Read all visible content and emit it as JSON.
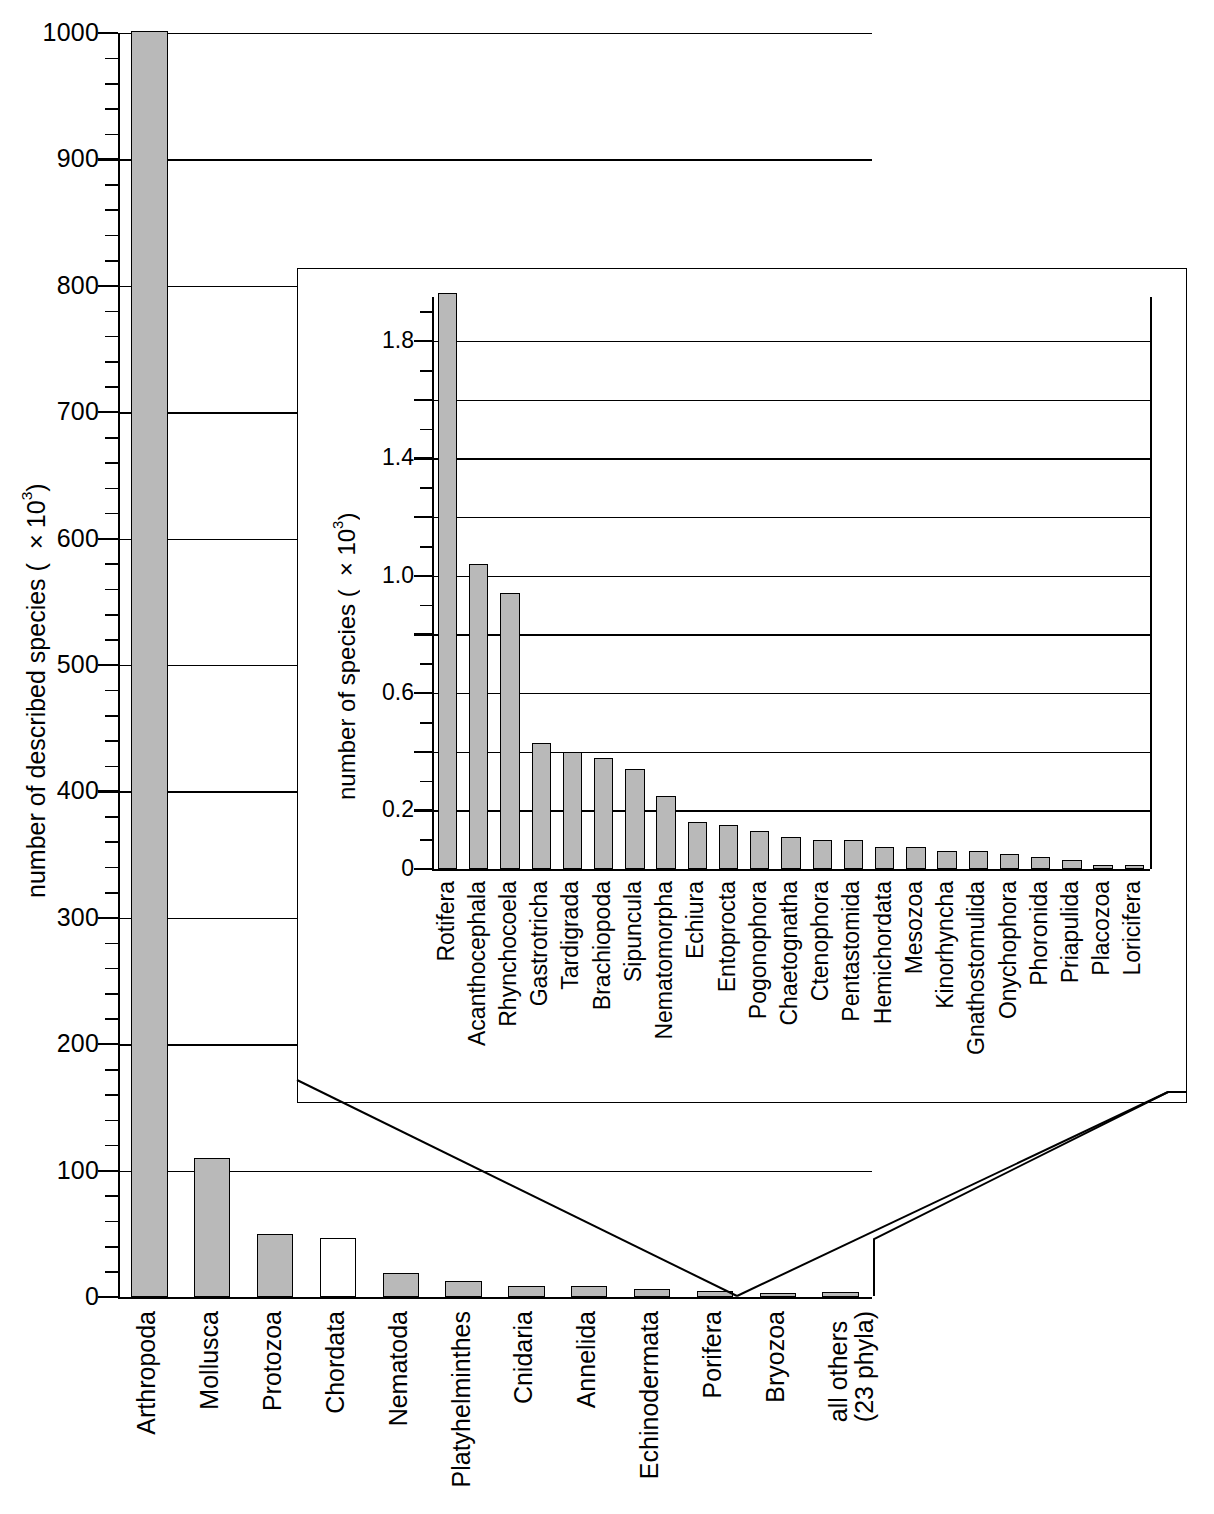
{
  "chart_data": {
    "type": "bar",
    "title": "",
    "panels": [
      {
        "name": "main",
        "ylabel": "number of described species (×10³)",
        "ylabel_base": "number of described species ( ×10",
        "ylabel_exp": "3",
        "ylabel_close": ")",
        "ylim": [
          0,
          1000
        ],
        "ytick_step": 100,
        "yminor_step": 20,
        "grid": true,
        "legend": "none",
        "yticks": [
          "0",
          "100",
          "200",
          "300",
          "400",
          "500",
          "600",
          "700",
          "800",
          "900",
          "1000"
        ],
        "categories": [
          "Arthropoda",
          "Mollusca",
          "Protozoa",
          "Chordata",
          "Nematoda",
          "Platyhelminthes",
          "Cnidaria",
          "Annelida",
          "Echinodermata",
          "Porifera",
          "Bryozoa",
          "all others\n(23 phyla)"
        ],
        "values": [
          1065,
          110,
          50,
          47,
          19,
          13,
          9,
          9,
          6,
          5,
          3,
          4
        ],
        "fills": [
          "gray",
          "gray",
          "gray",
          "white",
          "gray",
          "gray",
          "gray",
          "gray",
          "gray",
          "gray",
          "gray",
          "gray"
        ],
        "clipped": [
          true,
          false,
          false,
          false,
          false,
          false,
          false,
          false,
          false,
          false,
          false,
          false
        ]
      },
      {
        "name": "inset",
        "ylabel": "number of species (×10³)",
        "ylabel_base": "number of species ( ×10",
        "ylabel_exp": "3",
        "ylabel_close": ")",
        "ylim": [
          0,
          1.95
        ],
        "ytick_step": 0.2,
        "yminor_step": 0.1,
        "grid": true,
        "legend": "none",
        "yticks": [
          "0",
          "0.2",
          "0.6",
          "1.0",
          "1.4",
          "1.8"
        ],
        "ytick_values": [
          0,
          0.2,
          0.6,
          1.0,
          1.4,
          1.8
        ],
        "categories": [
          "Rotifera",
          "Acanthocephala",
          "Rhynchocoela",
          "Gastrotricha",
          "Tardigrada",
          "Brachiopoda",
          "Sipuncula",
          "Nematomorpha",
          "Echiura",
          "Entoprocta",
          "Pogonophora",
          "Chaetognatha",
          "Ctenophora",
          "Pentastomida",
          "Hemichordata",
          "Mesozoa",
          "Kinorhyncha",
          "Gnathostomulida",
          "Onychophora",
          "Phoronida",
          "Priapulida",
          "Placozoa",
          "Loricifera"
        ],
        "values": [
          2.0,
          1.04,
          0.94,
          0.43,
          0.4,
          0.38,
          0.34,
          0.25,
          0.16,
          0.15,
          0.13,
          0.11,
          0.1,
          0.1,
          0.075,
          0.075,
          0.06,
          0.06,
          0.05,
          0.04,
          0.03,
          0.015,
          0.012
        ],
        "fills": [
          "gray",
          "gray",
          "gray",
          "gray",
          "gray",
          "gray",
          "gray",
          "gray",
          "gray",
          "gray",
          "gray",
          "gray",
          "gray",
          "gray",
          "gray",
          "gray",
          "gray",
          "gray",
          "gray",
          "gray",
          "gray",
          "gray",
          "gray"
        ],
        "clipped": [
          true,
          false,
          false,
          false,
          false,
          false,
          false,
          false,
          false,
          false,
          false,
          false,
          false,
          false,
          false,
          false,
          false,
          false,
          false,
          false,
          false,
          false,
          false
        ]
      }
    ],
    "colors": {
      "bar_fill": "#b9b9b9",
      "bar_open_fill": "#ffffff",
      "bar_stroke": "#000000",
      "axis": "#000000",
      "background": "#ffffff"
    },
    "annotations": {
      "callout": "leader lines from the 'all others (23 phyla)' bar to the inset panel"
    }
  }
}
